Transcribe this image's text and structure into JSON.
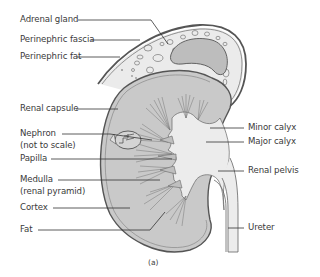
{
  "figure": {
    "caption": "(a)",
    "colors": {
      "kidney_fill": "#c9c9c9",
      "medulla_fill": "#b9b9b9",
      "pelvis_fill": "#ececec",
      "adrenal_fill": "#bdbdbd",
      "fat_fill": "#ebebeb",
      "outline": "#555555",
      "leader_line": "#333333",
      "label_text": "#3a3a3a"
    }
  },
  "labels_left": [
    {
      "id": "adrenal-gland",
      "text": "Adrenal gland"
    },
    {
      "id": "perinephric-fascia",
      "text": "Perinephric fascia"
    },
    {
      "id": "perinephric-fat",
      "text": "Perinephric fat"
    },
    {
      "id": "renal-capsule",
      "text": "Renal capsule"
    },
    {
      "id": "nephron",
      "text": "Nephron",
      "subtext": "(not to scale)"
    },
    {
      "id": "papilla",
      "text": "Papilla"
    },
    {
      "id": "medulla",
      "text": "Medulla",
      "subtext": "(renal pyramid)"
    },
    {
      "id": "cortex",
      "text": "Cortex"
    },
    {
      "id": "fat",
      "text": "Fat"
    }
  ],
  "labels_right": [
    {
      "id": "minor-calyx",
      "text": "Minor calyx"
    },
    {
      "id": "major-calyx",
      "text": "Major calyx"
    },
    {
      "id": "renal-pelvis",
      "text": "Renal pelvis"
    },
    {
      "id": "ureter",
      "text": "Ureter"
    }
  ]
}
